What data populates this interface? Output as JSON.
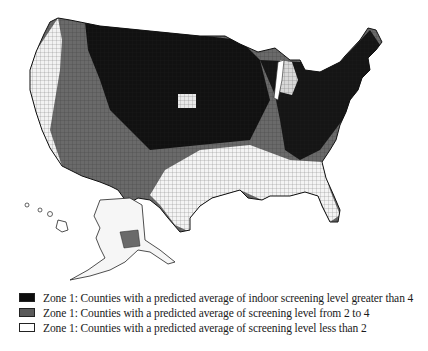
{
  "map": {
    "subject": "United States counties by predicted indoor radon screening level zone",
    "regions_shown": [
      "Contiguous United States",
      "Alaska",
      "Hawaii"
    ],
    "colors": {
      "zone_high": "#0d0d0d",
      "zone_mid": "#5a5a5a",
      "zone_low": "#ffffff",
      "border": "#222222"
    }
  },
  "legend": {
    "items": [
      {
        "swatch_color": "#0d0d0d",
        "label": "Zone 1: Counties with a predicted average of indoor screening level greater than 4"
      },
      {
        "swatch_color": "#5a5a5a",
        "label": "Zone 1: Counties with a predicted average of screening level from 2 to 4"
      },
      {
        "swatch_color": "#ffffff",
        "label": "Zone 1: Counties with a predicted average of screening level less than 2"
      }
    ]
  }
}
